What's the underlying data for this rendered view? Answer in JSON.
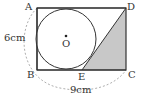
{
  "diagram": {
    "points": {
      "A": {
        "label": "A"
      },
      "B": {
        "label": "B"
      },
      "C": {
        "label": "C"
      },
      "D": {
        "label": "D"
      },
      "E": {
        "label": "E"
      },
      "O": {
        "label": "O"
      }
    },
    "dimensions": {
      "height": "6cm",
      "width": "9cm"
    },
    "colors": {
      "stroke": "#333333",
      "shade": "#c8c8c8",
      "dashed": "#999999"
    }
  }
}
